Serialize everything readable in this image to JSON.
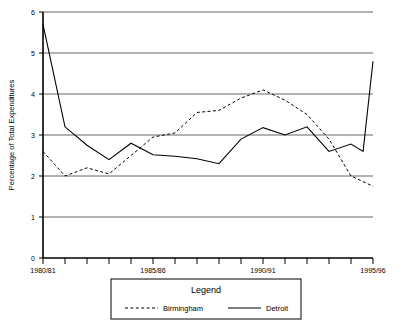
{
  "chart_data": {
    "type": "line",
    "title": "",
    "xlabel": "",
    "ylabel": "Percentage of Total Expenditures",
    "ylim": [
      0,
      6
    ],
    "yticks": [
      0,
      1,
      2,
      3,
      4,
      5,
      6
    ],
    "ytick_labels": [
      "0",
      "1",
      "2",
      "3",
      "4",
      "5",
      "6"
    ],
    "grid": true,
    "grid_axis": "y",
    "legend_position": "below-plot",
    "legend_title": "Legend",
    "categories": [
      "1980/81",
      "1981/82",
      "1982/83",
      "1983/84",
      "1984/85",
      "1985/86",
      "1986/87",
      "1987/88",
      "1988/89",
      "1989/90",
      "1990/91",
      "1991/92",
      "1992/93",
      "1993/94",
      "1994/95",
      "1995/96"
    ],
    "xtick_labels_shown": [
      "1980/81",
      "1985/86",
      "1990/91",
      "1995/96"
    ],
    "xtick_label_indices": [
      0,
      5,
      10,
      15
    ],
    "series": [
      {
        "name": "Birmingham",
        "style": "dashed",
        "color": "#000000",
        "values": [
          2.6,
          2.0,
          2.2,
          2.05,
          2.5,
          2.95,
          3.05,
          3.55,
          3.6,
          3.9,
          4.1,
          3.85,
          3.5,
          2.9,
          2.0,
          1.75
        ]
      },
      {
        "name": "Detroit",
        "style": "solid",
        "color": "#000000",
        "values": [
          5.7,
          3.2,
          2.75,
          2.4,
          2.8,
          2.52,
          2.48,
          2.42,
          2.3,
          2.9,
          3.18,
          3.0,
          3.2,
          2.6,
          2.78,
          2.6
        ]
      }
    ],
    "detroit_end_spike": 4.8
  },
  "legend": {
    "title": "Legend",
    "entries": [
      {
        "label": "Birmingham",
        "style": "dashed"
      },
      {
        "label": "Detroit",
        "style": "solid"
      }
    ]
  },
  "axes": {
    "y_title": "Percentage of Total Expenditures",
    "y_tick_0": "0",
    "y_tick_1": "1",
    "y_tick_2": "2",
    "y_tick_3": "3",
    "y_tick_4": "4",
    "y_tick_5": "5",
    "y_tick_6": "6",
    "x_tick_first": "1980/81",
    "x_tick_mid1": "1985/86",
    "x_tick_mid2": "1990/91",
    "x_tick_last": "1995/96"
  },
  "colors": {
    "line": "#000000",
    "grid": "#666666",
    "axis": "#000000",
    "background": "#ffffff"
  }
}
